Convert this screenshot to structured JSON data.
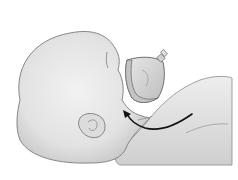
{
  "illustration": {
    "subject": "Infant lying supine with face mask over nose and mouth",
    "elements": [
      "infant-head",
      "ear",
      "closed-eye",
      "face-mask",
      "mask-connector",
      "shoulder",
      "curved-arrow"
    ],
    "arrow_direction": "upward toward chin (head tilt / jaw lift)",
    "colors": {
      "background": "#ffffff",
      "skin": "#e6e6e6",
      "skin_shadow": "#c8c8c8",
      "outline": "#7a7a7a",
      "mask": "#d9d9d9",
      "arrow": "#111111"
    }
  }
}
